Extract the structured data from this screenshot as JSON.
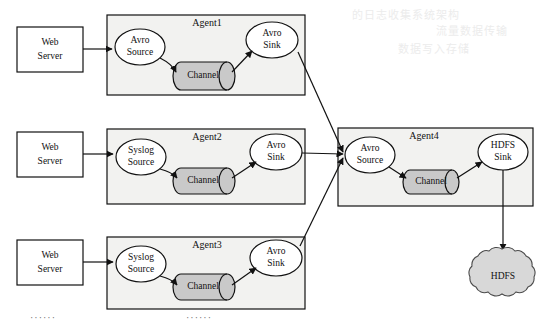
{
  "figure": {
    "background_color": "#ffffff",
    "box_fill": "#f2f2f0",
    "node_fill": "#ffffff",
    "channel_fill": "#c9c9c9",
    "cloud_fill": "#d8d8d8",
    "stroke_color": "#111111"
  },
  "web_servers": [
    {
      "id": "ws1",
      "line1": "Web",
      "line2": "Server"
    },
    {
      "id": "ws2",
      "line1": "Web",
      "line2": "Server"
    },
    {
      "id": "ws3",
      "line1": "Web",
      "line2": "Server"
    }
  ],
  "agents": [
    {
      "id": "agent1",
      "title": "Agent1",
      "source": {
        "line1": "Avro",
        "line2": "Source"
      },
      "channel": {
        "label": "Channel"
      },
      "sink": {
        "line1": "Avro",
        "line2": "Sink"
      }
    },
    {
      "id": "agent2",
      "title": "Agent2",
      "source": {
        "line1": "Syslog",
        "line2": "Source"
      },
      "channel": {
        "label": "Channel"
      },
      "sink": {
        "line1": "Avro",
        "line2": "Sink"
      }
    },
    {
      "id": "agent3",
      "title": "Agent3",
      "source": {
        "line1": "Syslog",
        "line2": "Source"
      },
      "channel": {
        "label": "Channel"
      },
      "sink": {
        "line1": "Avro",
        "line2": "Sink"
      }
    },
    {
      "id": "agent4",
      "title": "Agent4",
      "source": {
        "line1": "Avro",
        "line2": "Source"
      },
      "channel": {
        "label": "Channel"
      },
      "sink": {
        "line1": "HDFS",
        "line2": "Sink"
      }
    }
  ],
  "storage": {
    "label": "HDFS",
    "shape": "cloud"
  },
  "ellipses": [
    {
      "id": "ell-left",
      "text": "······"
    },
    {
      "id": "ell-mid",
      "text": "······"
    }
  ],
  "bleed_text": [
    {
      "id": "bleed-1",
      "text": "的日志收集系统架构"
    },
    {
      "id": "bleed-2",
      "text": "流量数据传输"
    },
    {
      "id": "bleed-3",
      "text": "数据写入存储"
    }
  ]
}
